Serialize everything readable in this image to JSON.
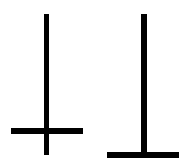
{
  "diagram": {
    "background": "#ffffff",
    "stroke_color": "#000000",
    "figures": [
      {
        "name": "inverted-cross",
        "vertical": {
          "x": 44,
          "y": 14,
          "w": 5,
          "h": 141
        },
        "horizontal": {
          "x": 11,
          "y": 128,
          "w": 72,
          "h": 6
        }
      },
      {
        "name": "inverted-t",
        "vertical": {
          "x": 141,
          "y": 14,
          "w": 6,
          "h": 141
        },
        "horizontal": {
          "x": 107,
          "y": 152,
          "w": 72,
          "h": 6
        }
      }
    ]
  }
}
